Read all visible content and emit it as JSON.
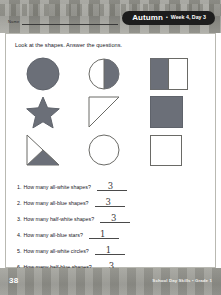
{
  "header": {
    "name_label": "Name",
    "banner": {
      "season": "Autumn",
      "separator": "•",
      "week_day": "Week 4, Day 3"
    }
  },
  "worksheet": {
    "instruction": "Look at the shapes. Answer the questions.",
    "shapes": [
      [
        {
          "name": "all-blue-circle",
          "shape": "circle",
          "fill": "all",
          "color": "#6b6f78"
        },
        {
          "name": "half-blue-circle",
          "shape": "circle",
          "fill": "half-right",
          "color": "#6b6f78"
        },
        {
          "name": "half-blue-rectangle",
          "shape": "rectangle",
          "fill": "half-left",
          "color": "#6b6f78"
        }
      ],
      [
        {
          "name": "all-blue-star",
          "shape": "star",
          "fill": "all",
          "color": "#6b6f78"
        },
        {
          "name": "all-white-triangle",
          "shape": "triangle",
          "fill": "none",
          "color": "#6b6f78"
        },
        {
          "name": "all-blue-square",
          "shape": "square",
          "fill": "all",
          "color": "#6b6f78"
        }
      ],
      [
        {
          "name": "half-blue-triangle",
          "shape": "triangle",
          "fill": "half-bottom",
          "color": "#6b6f78"
        },
        {
          "name": "all-white-circle",
          "shape": "circle",
          "fill": "none",
          "color": "#6b6f78"
        },
        {
          "name": "all-white-square",
          "shape": "square",
          "fill": "none",
          "color": "#6b6f78"
        }
      ]
    ],
    "questions": [
      {
        "number": "1.",
        "text": "How many all-white shapes?",
        "answer": "3"
      },
      {
        "number": "2.",
        "text": "How many all-blue shapes?",
        "answer": "3"
      },
      {
        "number": "3.",
        "text": "How many half-white shapes?",
        "answer": "3"
      },
      {
        "number": "4.",
        "text": "How many all-blue stars?",
        "answer": "1"
      },
      {
        "number": "5.",
        "text": "How many all-white circles?",
        "answer": "1"
      },
      {
        "number": "6.",
        "text": "How many half-blue shapes?",
        "answer": "3"
      }
    ]
  },
  "footer": {
    "page_number": "38",
    "credit": "School Day Skills • Grade 1"
  },
  "colors": {
    "shape_fill": "#6b6f78",
    "shape_stroke": "#6a6a66",
    "banner_bg": "#1d1d1d",
    "band_bg": "#95958f"
  }
}
